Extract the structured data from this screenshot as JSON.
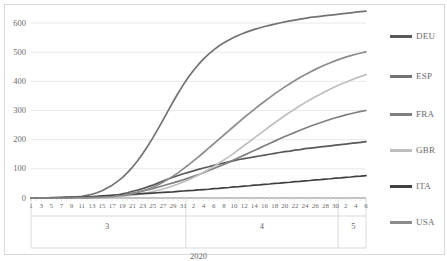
{
  "chart_data": {
    "type": "line",
    "title": "",
    "subtitle": "",
    "xlabel": "2020",
    "ylabel": "",
    "ylim": [
      0,
      600
    ],
    "yticks": [
      0,
      100,
      200,
      300,
      400,
      500,
      600
    ],
    "grid": true,
    "legend_position": "right",
    "x_axis_year": "2020",
    "x_groups": [
      {
        "label": "3",
        "ticks": [
          "1",
          "3",
          "5",
          "7",
          "9",
          "11",
          "13",
          "15",
          "17",
          "19",
          "21",
          "23",
          "25",
          "27",
          "29",
          "31"
        ]
      },
      {
        "label": "4",
        "ticks": [
          "2",
          "4",
          "6",
          "8",
          "10",
          "12",
          "14",
          "16",
          "18",
          "20",
          "22",
          "24",
          "26",
          "28",
          "30"
        ]
      },
      {
        "label": "5",
        "ticks": [
          "2",
          "4",
          "6"
        ]
      }
    ],
    "x": [
      "3-1",
      "3-2",
      "3-3",
      "3-4",
      "3-5",
      "3-6",
      "3-7",
      "3-8",
      "3-9",
      "3-10",
      "3-11",
      "3-12",
      "3-13",
      "3-14",
      "3-15",
      "3-16",
      "3-17",
      "3-18",
      "3-19",
      "3-20",
      "3-21",
      "3-22",
      "3-23",
      "3-24",
      "3-25",
      "3-26",
      "3-27",
      "3-28",
      "3-29",
      "3-30",
      "3-31",
      "4-1",
      "4-2",
      "4-3",
      "4-4",
      "4-5",
      "4-6",
      "4-7",
      "4-8",
      "4-9",
      "4-10",
      "4-11",
      "4-12",
      "4-13",
      "4-14",
      "4-15",
      "4-16",
      "4-17",
      "4-18",
      "4-19",
      "4-20",
      "4-21",
      "4-22",
      "4-23",
      "4-24",
      "4-25",
      "4-26",
      "4-27",
      "4-28",
      "4-29",
      "4-30",
      "5-1",
      "5-2",
      "5-3",
      "5-4",
      "5-5",
      "5-6"
    ],
    "series": [
      {
        "name": "DEU",
        "color": "#595959",
        "values": [
          0,
          0,
          0,
          0,
          0,
          0,
          1,
          1,
          1,
          1,
          2,
          2,
          3,
          4,
          5,
          6,
          8,
          10,
          14,
          18,
          23,
          27,
          32,
          38,
          44,
          51,
          58,
          65,
          71,
          77,
          83,
          88,
          93,
          98,
          103,
          107,
          112,
          116,
          120,
          124,
          128,
          132,
          135,
          138,
          141,
          144,
          147,
          150,
          153,
          156,
          159,
          161,
          164,
          166,
          169,
          171,
          173,
          175,
          177,
          179,
          181,
          183,
          185,
          187,
          189,
          191,
          193
        ]
      },
      {
        "name": "ESP",
        "color": "#737373",
        "values": [
          0,
          0,
          0,
          0,
          0,
          1,
          1,
          2,
          3,
          4,
          6,
          9,
          13,
          18,
          25,
          34,
          44,
          56,
          70,
          87,
          106,
          128,
          152,
          178,
          206,
          236,
          267,
          299,
          330,
          360,
          388,
          414,
          437,
          458,
          477,
          493,
          508,
          521,
          532,
          542,
          551,
          559,
          566,
          572,
          578,
          583,
          588,
          592,
          596,
          600,
          604,
          607,
          610,
          613,
          616,
          619,
          621,
          623,
          625,
          627,
          629,
          631,
          633,
          635,
          637,
          639,
          641
        ]
      },
      {
        "name": "FRA",
        "color": "#808080",
        "values": [
          0,
          0,
          0,
          0,
          0,
          0,
          0,
          0,
          1,
          1,
          1,
          2,
          2,
          3,
          4,
          5,
          7,
          9,
          11,
          14,
          17,
          20,
          24,
          28,
          32,
          37,
          42,
          47,
          52,
          57,
          62,
          68,
          74,
          80,
          87,
          94,
          101,
          108,
          115,
          123,
          131,
          139,
          147,
          155,
          163,
          171,
          179,
          187,
          195,
          203,
          211,
          218,
          225,
          232,
          239,
          246,
          252,
          258,
          264,
          270,
          275,
          280,
          285,
          289,
          293,
          297,
          300
        ]
      },
      {
        "name": "GBR",
        "color": "#bfbfbf",
        "values": [
          0,
          0,
          0,
          0,
          0,
          0,
          0,
          0,
          0,
          0,
          1,
          1,
          1,
          2,
          2,
          3,
          4,
          5,
          6,
          8,
          10,
          12,
          15,
          18,
          22,
          26,
          31,
          36,
          42,
          48,
          55,
          62,
          70,
          79,
          88,
          98,
          108,
          119,
          130,
          142,
          154,
          167,
          180,
          193,
          206,
          219,
          232,
          245,
          258,
          270,
          282,
          294,
          305,
          316,
          327,
          337,
          347,
          356,
          365,
          374,
          382,
          390,
          397,
          404,
          411,
          417,
          423
        ]
      },
      {
        "name": "ITA",
        "color": "#404040",
        "values": [
          0,
          0,
          0,
          0,
          1,
          1,
          1,
          2,
          2,
          3,
          3,
          4,
          5,
          6,
          7,
          8,
          9,
          10,
          11,
          12,
          13,
          14,
          15,
          16,
          17,
          18,
          19,
          20,
          21,
          23,
          24,
          25,
          26,
          28,
          29,
          30,
          32,
          33,
          35,
          36,
          38,
          39,
          41,
          42,
          44,
          45,
          47,
          48,
          50,
          51,
          53,
          54,
          56,
          57,
          59,
          60,
          62,
          63,
          65,
          66,
          68,
          69,
          71,
          72,
          74,
          75,
          77
        ]
      },
      {
        "name": "USA",
        "color": "#8c8c8c",
        "values": [
          0,
          0,
          0,
          0,
          0,
          0,
          0,
          0,
          0,
          1,
          1,
          1,
          2,
          2,
          3,
          4,
          5,
          7,
          9,
          12,
          15,
          19,
          24,
          30,
          37,
          45,
          54,
          64,
          75,
          87,
          100,
          113,
          127,
          141,
          156,
          171,
          186,
          201,
          216,
          231,
          246,
          261,
          276,
          290,
          304,
          318,
          331,
          344,
          357,
          369,
          381,
          392,
          403,
          413,
          423,
          432,
          441,
          449,
          457,
          464,
          471,
          477,
          483,
          488,
          493,
          497,
          501
        ]
      }
    ]
  },
  "legend": {
    "items": [
      {
        "label": "DEU",
        "color": "#595959"
      },
      {
        "label": "ESP",
        "color": "#737373"
      },
      {
        "label": "FRA",
        "color": "#808080"
      },
      {
        "label": "GBR",
        "color": "#bfbfbf"
      },
      {
        "label": "ITA",
        "color": "#404040"
      },
      {
        "label": "USA",
        "color": "#8c8c8c"
      }
    ]
  },
  "axis": {
    "y_labels": [
      "600",
      "500",
      "400",
      "300",
      "200",
      "100",
      "0"
    ],
    "year_label": "2020",
    "group_labels": [
      "3",
      "4",
      "5"
    ]
  }
}
